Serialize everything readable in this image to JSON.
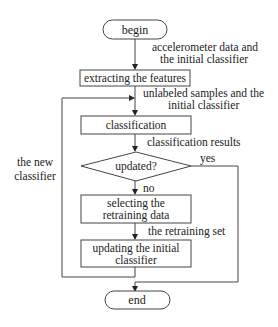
{
  "nodes": {
    "begin": "begin",
    "extract": "extracting the features",
    "classify": "classification",
    "decision": "updated?",
    "select_line1": "selecting the",
    "select_line2": "retraining data",
    "update_line1": "updating the initial",
    "update_line2": "classifier",
    "end": "end"
  },
  "edge_labels": {
    "accel_line1": "accelerometer data and",
    "accel_line2": "the initial classifier",
    "unlabeled_line1": "unlabeled samples and the",
    "unlabeled_line2": "initial classifier",
    "results": "classification results",
    "yes": "yes",
    "no": "no",
    "retraining_set": "the retraining set",
    "new_classifier_line1": "the new",
    "new_classifier_line2": "classifier"
  },
  "colors": {
    "stroke": "#444444",
    "text": "#222222",
    "background": "#ffffff"
  }
}
